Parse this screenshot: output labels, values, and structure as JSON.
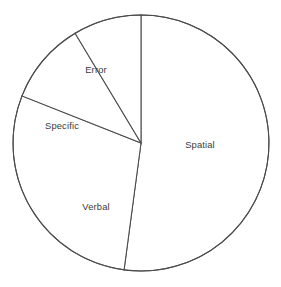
{
  "chart_data": {
    "type": "pie",
    "title": "",
    "subtitle": "",
    "xlabel": "",
    "ylabel": "",
    "grid": false,
    "legend": false,
    "legend_position": "none",
    "labels_inside_slices": true,
    "categories": [
      "Spatial",
      "Verbal",
      "Specific",
      "Error"
    ],
    "values": [
      52,
      29,
      10,
      9
    ],
    "units": "percent",
    "angles_degrees": [
      187.6,
      104.0,
      37.4,
      31.0
    ],
    "start_angle_degrees": 90,
    "direction": "clockwise",
    "slices": [
      {
        "label": "Spatial",
        "value": 52,
        "angle_degrees": 187.6,
        "start_angle_degrees": 90,
        "end_angle_degrees": -97.6,
        "fill": "#ffffff",
        "stroke": "#4b4b4b"
      },
      {
        "label": "Verbal",
        "value": 29,
        "angle_degrees": 104.0,
        "start_angle_degrees": -97.6,
        "end_angle_degrees": -201.6,
        "fill": "#ffffff",
        "stroke": "#4b4b4b"
      },
      {
        "label": "Specific",
        "value": 10,
        "angle_degrees": 37.4,
        "start_angle_degrees": -201.6,
        "end_angle_degrees": -239.0,
        "fill": "#ffffff",
        "stroke": "#4b4b4b"
      },
      {
        "label": "Error",
        "value": 9,
        "angle_degrees": 31.0,
        "start_angle_degrees": -239.0,
        "end_angle_degrees": -270.0,
        "fill": "#ffffff",
        "stroke": "#4b4b4b"
      }
    ],
    "geometry": {
      "center_x": 141,
      "center_y": 143,
      "radius": 128
    },
    "colors": {
      "background": "#ffffff",
      "outline": "#4b4b4b",
      "label_text": "#3b3b3b"
    },
    "label_positions": [
      {
        "label": "Spatial",
        "x": 200,
        "y": 146
      },
      {
        "label": "Verbal",
        "x": 96,
        "y": 208
      },
      {
        "label": "Specific",
        "x": 62,
        "y": 127
      },
      {
        "label": "Error",
        "x": 96,
        "y": 71
      }
    ]
  }
}
